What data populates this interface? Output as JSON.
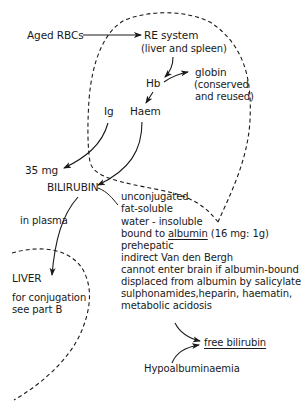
{
  "diagram": {
    "type": "flow-diagram",
    "nodes": {
      "aged_rbcs": "Aged RBCs",
      "re_system": "RE system",
      "re_system_sub": "(liver and spleen)",
      "hb": "Hb",
      "globin": "globin",
      "globin_note_1": "(conserved",
      "globin_note_2": "and reused)",
      "ig": "Ig",
      "haem": "Haem",
      "amount": "35 mg",
      "bilirubin": "BILIRUBIN",
      "in_plasma": "in plasma",
      "liver": "LIVER",
      "liver_note_1": "for conjugation",
      "liver_note_2": "see part B",
      "free_bilirubin": "free bilirubin",
      "hypoalbuminaemia": "Hypoalbuminaemia"
    },
    "properties": {
      "line1": "unconjugated",
      "line2": "fat-soluble",
      "line3": "water - insoluble",
      "line4_pre": "bound to ",
      "line4_albumin": "albumin",
      "line4_post": " (16 mg: 1g)",
      "line5": "prehepatic",
      "line6": "indirect  Van den Bergh",
      "line7": "cannot enter brain if albumin-bound",
      "line8": "displaced from albumin by salicylates,",
      "line9": "sulphonamides,heparin, haematin,",
      "line10": "metabolic acidosis"
    },
    "edges": [
      {
        "from": "Aged RBCs",
        "to": "RE system"
      },
      {
        "from": "RE system",
        "to": "Hb"
      },
      {
        "from": "Hb",
        "to": "globin"
      },
      {
        "from": "Hb",
        "to": "Haem"
      },
      {
        "from": "Ig",
        "to": "35 mg"
      },
      {
        "from": "Haem",
        "to": "BILIRUBIN"
      },
      {
        "from": "BILIRUBIN",
        "to": "properties"
      },
      {
        "from": "BILIRUBIN",
        "to": "LIVER",
        "label": "in plasma"
      },
      {
        "from": "metabolic acidosis",
        "to": "free bilirubin"
      },
      {
        "from": "Hypoalbuminaemia",
        "to": "free bilirubin"
      }
    ],
    "regions": [
      "RE system (dashed boundary)",
      "LIVER (dashed boundary)"
    ],
    "colors": {
      "ink": "#1a1a1a",
      "background": "#ffffff"
    }
  }
}
